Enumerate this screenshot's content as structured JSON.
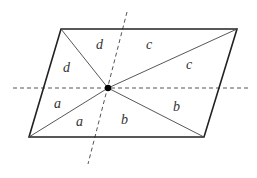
{
  "diagram": {
    "labels": {
      "top_left": "d",
      "top_right": "c",
      "left_upper": "d",
      "right_upper": "c",
      "left_lower": "a",
      "right_lower": "b",
      "bottom_left": "a",
      "bottom_right": "b"
    },
    "colors": {
      "stroke": "#222222",
      "dashed": "#555555",
      "point": "#000000"
    }
  }
}
